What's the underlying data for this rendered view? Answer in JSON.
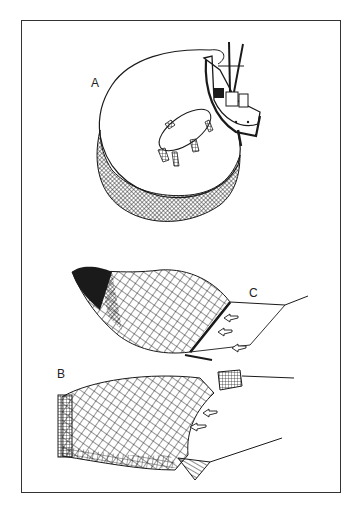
{
  "figure": {
    "frame_color": "#333333",
    "ink_color": "#1a1a1a",
    "background": "#ffffff",
    "panels": [
      {
        "id": "A",
        "label": "A",
        "depicts": "purse seine encircling with vessel"
      },
      {
        "id": "C",
        "label": "C",
        "depicts": "beam/frame trawl net with fish arrows"
      },
      {
        "id": "B",
        "label": "B",
        "depicts": "otter trawl net with doors and fish arrows"
      }
    ]
  }
}
